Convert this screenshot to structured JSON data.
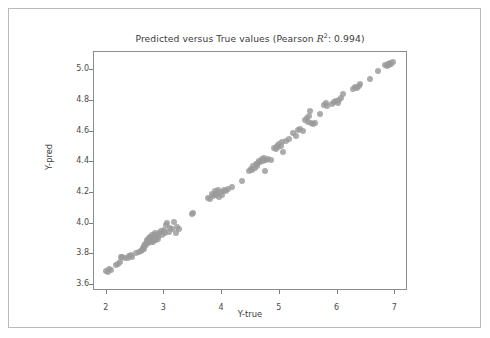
{
  "chart_data": {
    "type": "scatter",
    "title": "Predicted versus True values (Pearson R2: 0.994)",
    "title_parts": {
      "prefix": "Predicted versus True values (Pearson ",
      "rsymbol": "R",
      "rexp": "2",
      "suffix": ": 0.994)"
    },
    "pearson_r2": 0.994,
    "xlabel": "Y-true",
    "ylabel": "Y-pred",
    "xlim": [
      1.78,
      7.22
    ],
    "ylim": [
      3.56,
      5.12
    ],
    "xticks": [
      2,
      3,
      4,
      5,
      6,
      7
    ],
    "xtick_labels": [
      "2",
      "3",
      "4",
      "5",
      "6",
      "7"
    ],
    "yticks": [
      3.6,
      3.8,
      4.0,
      4.2,
      4.4,
      4.6,
      4.8,
      5.0
    ],
    "ytick_labels": [
      "3.6",
      "3.8",
      "4.0",
      "4.2",
      "4.4",
      "4.6",
      "4.8",
      "5.0"
    ],
    "grid": false,
    "legend": null,
    "marker": {
      "shape": "circle",
      "color": "#9a9a9a",
      "opacity": 0.82,
      "size_px": 6
    },
    "n_points": 124,
    "points": [
      [
        2.01,
        3.685
      ],
      [
        2.04,
        3.679
      ],
      [
        2.06,
        3.695
      ],
      [
        2.09,
        3.69
      ],
      [
        2.17,
        3.723
      ],
      [
        2.21,
        3.728
      ],
      [
        2.24,
        3.742
      ],
      [
        2.27,
        3.777
      ],
      [
        2.29,
        3.773
      ],
      [
        2.33,
        3.766
      ],
      [
        2.38,
        3.772
      ],
      [
        2.41,
        3.779
      ],
      [
        2.44,
        3.786
      ],
      [
        2.46,
        3.773
      ],
      [
        2.52,
        3.799
      ],
      [
        2.57,
        3.806
      ],
      [
        2.61,
        3.812
      ],
      [
        2.63,
        3.82
      ],
      [
        2.64,
        3.836
      ],
      [
        2.66,
        3.829
      ],
      [
        2.67,
        3.846
      ],
      [
        2.68,
        3.861
      ],
      [
        2.7,
        3.852
      ],
      [
        2.71,
        3.873
      ],
      [
        2.72,
        3.888
      ],
      [
        2.73,
        3.866
      ],
      [
        2.74,
        3.879
      ],
      [
        2.75,
        3.897
      ],
      [
        2.76,
        3.908
      ],
      [
        2.77,
        3.884
      ],
      [
        2.78,
        3.872
      ],
      [
        2.79,
        3.901
      ],
      [
        2.8,
        3.918
      ],
      [
        2.81,
        3.893
      ],
      [
        2.82,
        3.875
      ],
      [
        2.83,
        3.906
      ],
      [
        2.84,
        3.889
      ],
      [
        2.85,
        3.922
      ],
      [
        2.86,
        3.935
      ],
      [
        2.87,
        3.901
      ],
      [
        2.88,
        3.884
      ],
      [
        2.9,
        3.912
      ],
      [
        2.91,
        3.896
      ],
      [
        2.93,
        3.929
      ],
      [
        2.95,
        3.943
      ],
      [
        2.97,
        3.921
      ],
      [
        2.99,
        3.938
      ],
      [
        3.01,
        3.954
      ],
      [
        3.03,
        3.932
      ],
      [
        3.05,
        3.983
      ],
      [
        3.07,
        3.997
      ],
      [
        3.09,
        3.941
      ],
      [
        3.12,
        3.963
      ],
      [
        3.15,
        3.956
      ],
      [
        3.18,
        4.002
      ],
      [
        3.21,
        3.931
      ],
      [
        3.24,
        3.968
      ],
      [
        3.27,
        3.957
      ],
      [
        3.49,
        4.055
      ],
      [
        3.52,
        4.061
      ],
      [
        3.78,
        4.162
      ],
      [
        3.81,
        4.155
      ],
      [
        3.84,
        4.186
      ],
      [
        3.86,
        4.171
      ],
      [
        3.89,
        4.203
      ],
      [
        3.91,
        4.178
      ],
      [
        3.93,
        4.193
      ],
      [
        3.95,
        4.212
      ],
      [
        3.97,
        4.167
      ],
      [
        3.99,
        4.199
      ],
      [
        4.02,
        4.183
      ],
      [
        4.05,
        4.214
      ],
      [
        4.08,
        4.206
      ],
      [
        4.12,
        4.221
      ],
      [
        4.18,
        4.235
      ],
      [
        4.36,
        4.272
      ],
      [
        4.48,
        4.339
      ],
      [
        4.51,
        4.351
      ],
      [
        4.54,
        4.344
      ],
      [
        4.56,
        4.367
      ],
      [
        4.58,
        4.358
      ],
      [
        4.6,
        4.381
      ],
      [
        4.62,
        4.372
      ],
      [
        4.64,
        4.389
      ],
      [
        4.66,
        4.402
      ],
      [
        4.68,
        4.396
      ],
      [
        4.7,
        4.413
      ],
      [
        4.72,
        4.405
      ],
      [
        4.74,
        4.421
      ],
      [
        4.76,
        4.336
      ],
      [
        4.78,
        4.408
      ],
      [
        4.82,
        4.416
      ],
      [
        4.86,
        4.411
      ],
      [
        4.92,
        4.487
      ],
      [
        4.95,
        4.478
      ],
      [
        4.97,
        4.503
      ],
      [
        4.99,
        4.492
      ],
      [
        5.01,
        4.511
      ],
      [
        5.03,
        4.498
      ],
      [
        5.06,
        4.523
      ],
      [
        5.08,
        4.459
      ],
      [
        5.12,
        4.534
      ],
      [
        5.18,
        4.548
      ],
      [
        5.24,
        4.583
      ],
      [
        5.29,
        4.562
      ],
      [
        5.33,
        4.604
      ],
      [
        5.37,
        4.611
      ],
      [
        5.41,
        4.598
      ],
      [
        5.46,
        4.668
      ],
      [
        5.48,
        4.682
      ],
      [
        5.5,
        4.659
      ],
      [
        5.52,
        4.695
      ],
      [
        5.54,
        4.728
      ],
      [
        5.56,
        4.651
      ],
      [
        5.6,
        4.643
      ],
      [
        5.63,
        4.648
      ],
      [
        5.72,
        4.712
      ],
      [
        5.78,
        4.766
      ],
      [
        5.81,
        4.781
      ],
      [
        5.84,
        4.758
      ],
      [
        5.92,
        4.773
      ],
      [
        5.96,
        4.789
      ],
      [
        5.99,
        4.796
      ],
      [
        6.02,
        4.781
      ],
      [
        6.05,
        4.802
      ],
      [
        6.08,
        4.812
      ],
      [
        6.11,
        4.842
      ],
      [
        6.28,
        4.872
      ],
      [
        6.32,
        4.886
      ],
      [
        6.35,
        4.879
      ],
      [
        6.38,
        4.893
      ],
      [
        6.41,
        4.902
      ],
      [
        6.58,
        4.938
      ],
      [
        6.72,
        4.988
      ],
      [
        6.84,
        5.026
      ],
      [
        6.87,
        5.019
      ],
      [
        6.89,
        5.038
      ],
      [
        6.91,
        5.031
      ],
      [
        6.93,
        5.044
      ],
      [
        6.95,
        5.036
      ],
      [
        6.97,
        5.048
      ]
    ]
  }
}
